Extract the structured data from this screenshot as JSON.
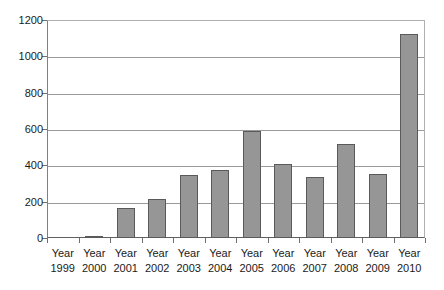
{
  "chart_data": {
    "type": "bar",
    "title": "",
    "subtitle": "",
    "xlabel": "",
    "ylabel": "",
    "categories": [
      "Year 1999",
      "Year 2000",
      "Year 2001",
      "Year 2002",
      "Year 2003",
      "Year 2004",
      "Year 2005",
      "Year 2006",
      "Year 2007",
      "Year 2008",
      "Year 2009",
      "Year 2010"
    ],
    "category_lines": [
      {
        "line1": "Year",
        "line2": "1999"
      },
      {
        "line1": "Year",
        "line2": "2000"
      },
      {
        "line1": "Year",
        "line2": "2001"
      },
      {
        "line1": "Year",
        "line2": "2002"
      },
      {
        "line1": "Year",
        "line2": "2003"
      },
      {
        "line1": "Year",
        "line2": "2004"
      },
      {
        "line1": "Year",
        "line2": "2005"
      },
      {
        "line1": "Year",
        "line2": "2006"
      },
      {
        "line1": "Year",
        "line2": "2007"
      },
      {
        "line1": "Year",
        "line2": "2008"
      },
      {
        "line1": "Year",
        "line2": "2009"
      },
      {
        "line1": "Year",
        "line2": "2010"
      }
    ],
    "values": [
      0,
      12,
      165,
      215,
      347,
      374,
      588,
      410,
      337,
      520,
      350,
      1125
    ],
    "ylim": [
      0,
      1200
    ],
    "yticks": [
      0,
      200,
      400,
      600,
      800,
      1000,
      1200
    ],
    "ytick_labels": [
      "0",
      "200",
      "400",
      "600",
      "800",
      "1000",
      "1200"
    ],
    "grid": true,
    "grid_axis": "y",
    "legend": false,
    "legend_position": "none",
    "bar_color": "#969696",
    "bar_border_color": "#5a5a5a",
    "gridline_color": "#9a9a9a",
    "axis_color": "#606060",
    "text_color": "#1a1a1a",
    "background_color": "#ffffff"
  }
}
